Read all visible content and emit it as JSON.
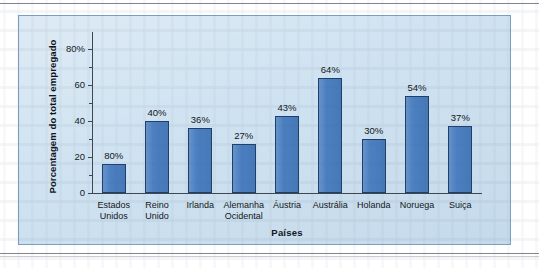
{
  "page": {
    "background_color": "#ffffff",
    "panel_color": "#cfe2f1",
    "panel_border_color": "#7ba0c4",
    "rule_color": "#6a6f78"
  },
  "chart_data": {
    "type": "bar",
    "title": "",
    "xlabel": "Países",
    "ylabel": "Porcentagem do total empregado",
    "ylim": [
      0,
      80
    ],
    "yticks": [
      0,
      20,
      40,
      60,
      80
    ],
    "ytick_labels": [
      "0",
      "20",
      "40",
      "60",
      "80%"
    ],
    "grid": false,
    "legend": null,
    "bar_color": "#4a7fc1",
    "bar_edge_color": "#1f3f68",
    "categories": [
      "Estados Unidos",
      "Reino Unido",
      "Irlanda",
      "Alemanha Ocidental",
      "Áustria",
      "Austrália",
      "Holanda",
      "Noruega",
      "Suiça"
    ],
    "category_lines": [
      [
        "Estados",
        "Unidos"
      ],
      [
        "Reino",
        "Unido"
      ],
      [
        "Irlanda"
      ],
      [
        "Alemanha",
        "Ocidental"
      ],
      [
        "Áustria"
      ],
      [
        "Austrália"
      ],
      [
        "Holanda"
      ],
      [
        "Noruega"
      ],
      [
        "Suiça"
      ]
    ],
    "values": [
      16,
      40,
      36,
      27,
      43,
      64,
      30,
      54,
      37
    ],
    "data_labels": [
      "80%",
      "40%",
      "36%",
      "27%",
      "43%",
      "64%",
      "30%",
      "54%",
      "37%"
    ]
  }
}
